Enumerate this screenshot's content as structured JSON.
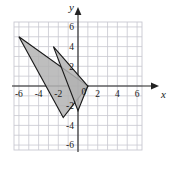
{
  "figure": {
    "kind": "coordinate-plane-geometry-figure",
    "background_color": "#ffffff",
    "grid_color": "#c8c8d0",
    "axis_color": "#222222",
    "shape_fill": "#b3b3b3",
    "shape_stroke": "#1a1a1a"
  },
  "axes": {
    "x_label": "x",
    "y_label": "y",
    "origin_label": "0",
    "x_min": -6.5,
    "x_max": 6.5,
    "y_min": -6.5,
    "y_max": 6.5,
    "grid_step": 1,
    "x_tick_labels": [
      "-6",
      "-4",
      "-2",
      "2",
      "4",
      "6"
    ],
    "x_tick_values": [
      -6,
      -4,
      -2,
      2,
      4,
      6
    ],
    "y_tick_labels": [
      "6",
      "4",
      "2",
      "-2",
      "-4",
      "-6"
    ],
    "y_tick_values": [
      6,
      4,
      2,
      -2,
      -4,
      -6
    ]
  },
  "chart_data": {
    "type": "scatter",
    "title": "",
    "xlabel": "x",
    "ylabel": "y",
    "xlim": [
      -6.5,
      6.5
    ],
    "ylim": [
      -6.5,
      6.5
    ],
    "grid": true,
    "legend": "none",
    "shapes": [
      {
        "name": "triangle-left",
        "type": "polygon",
        "vertices": [
          [
            -6,
            5
          ],
          [
            1,
            0
          ],
          [
            -1.5,
            -3.2
          ]
        ],
        "fill": "#b3b3b3",
        "stroke": "#1a1a1a"
      },
      {
        "name": "triangle-right",
        "type": "polygon",
        "vertices": [
          [
            -2.5,
            4
          ],
          [
            1,
            0
          ],
          [
            0,
            -2.5
          ]
        ],
        "fill": "#b3b3b3",
        "stroke": "#1a1a1a"
      }
    ]
  }
}
